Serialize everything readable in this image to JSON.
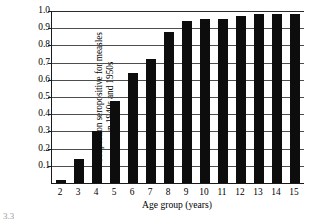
{
  "chart_data": {
    "type": "bar",
    "title": "",
    "subtitle": "",
    "xlabel": "Age group (years)",
    "ylabel": "Proportion seropositive for measles in 1940s and 1950s",
    "ylabel_lines": [
      "Proportion seropositive for measles",
      "in 1940s and 1950s"
    ],
    "categories": [
      "2",
      "3",
      "4",
      "5",
      "6",
      "7",
      "8",
      "9",
      "10",
      "11",
      "12",
      "13",
      "14",
      "15"
    ],
    "values": [
      0.015,
      0.14,
      0.3,
      0.475,
      0.64,
      0.72,
      0.88,
      0.94,
      0.955,
      0.955,
      0.97,
      0.985,
      0.985,
      0.985
    ],
    "ylim": [
      0.0,
      1.0
    ],
    "ytick_values": [
      1.0,
      0.9,
      0.8,
      0.7,
      0.6,
      0.5,
      0.4,
      0.3,
      0.2,
      0.1
    ],
    "ytick_labels": [
      "1.0",
      "0.9",
      "0.8",
      "0.7",
      "0.6",
      "0.5",
      "0.4",
      "0.3",
      "0.2",
      "0.1"
    ],
    "grid": true,
    "grid_axis": "y",
    "legend": false,
    "legend_position": "none",
    "bar_color": "#0d0d0d",
    "background_color": "#ffffff",
    "axis_color": "#1a1a1a",
    "gridline_color": "#4d4d4d"
  },
  "figure": {
    "caption_number": "3.3"
  }
}
